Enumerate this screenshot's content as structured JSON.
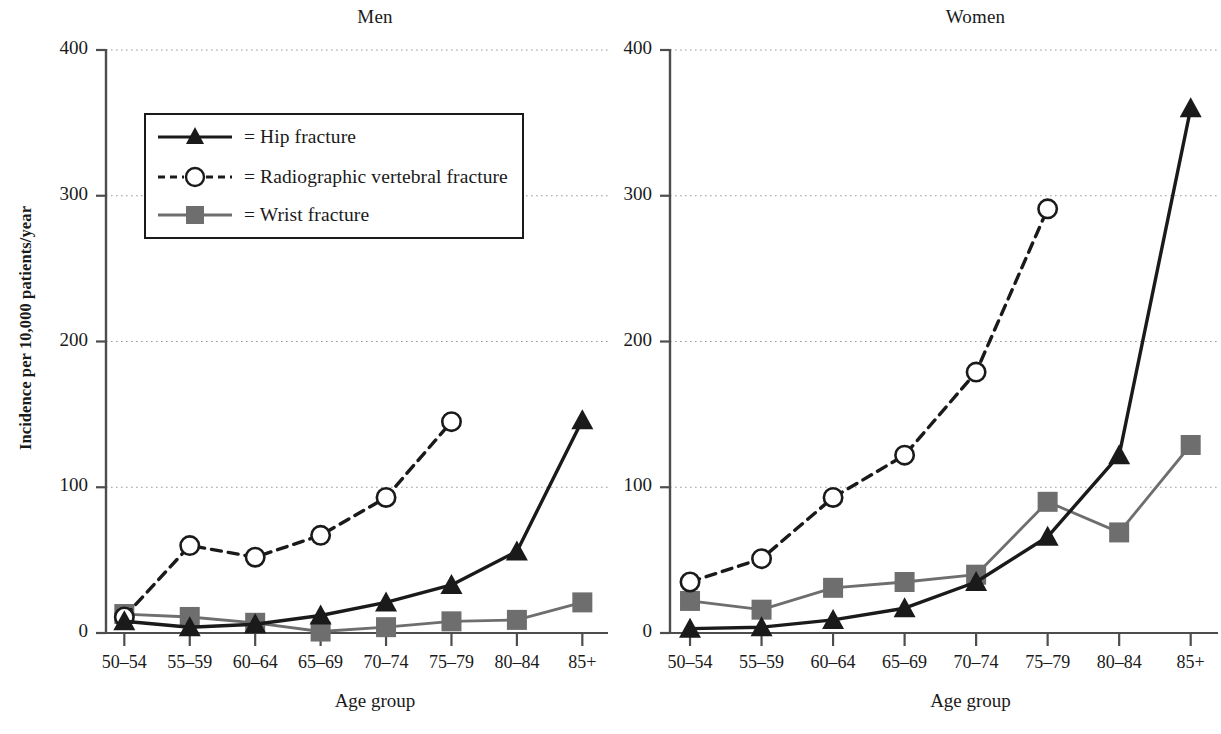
{
  "figure": {
    "axis_label_y": "Incidence per  10,000 patients/year",
    "axis_label_x": "Age group",
    "y_ticks": [
      "400",
      "300",
      "200",
      "100",
      "0"
    ],
    "x_ticks": [
      "50–54",
      "55–59",
      "60–64",
      "65–69",
      "70–74",
      "75–79",
      "80–84",
      "85+"
    ],
    "legend": {
      "hip": "= Hip fracture",
      "vertebral": "= Radiographic vertebral fracture",
      "wrist": "= Wrist fracture"
    },
    "colors": {
      "hip": "#1a1a1a",
      "vertebral": "#1a1a1a",
      "wrist": "#6e6e6e",
      "grid": "#9a9a9a",
      "axis": "#4d4d4d"
    },
    "panel_men_title": "Men",
    "panel_women_title": "Women"
  },
  "chart_data": [
    {
      "type": "line",
      "title": "Men",
      "xlabel": "Age group",
      "ylabel": "Incidence per 10,000 patients/year",
      "ylim": [
        0,
        400
      ],
      "yticks": [
        0,
        100,
        200,
        300,
        400
      ],
      "grid": true,
      "legend_position": "upper-left-inset",
      "categories": [
        "50-54",
        "55-59",
        "60-64",
        "65-69",
        "70-74",
        "75-79",
        "80-84",
        "85+"
      ],
      "series": [
        {
          "name": "Hip fracture",
          "marker": "filled-triangle",
          "linestyle": "solid",
          "color": "#1a1a1a",
          "values": [
            8,
            4,
            6,
            12,
            21,
            33,
            56,
            146
          ]
        },
        {
          "name": "Radiographic vertebral fracture",
          "marker": "open-circle",
          "linestyle": "dashed",
          "color": "#1a1a1a",
          "values": [
            11,
            60,
            52,
            67,
            93,
            145,
            null,
            null
          ]
        },
        {
          "name": "Wrist fracture",
          "marker": "filled-square",
          "linestyle": "solid",
          "color": "#6e6e6e",
          "values": [
            13,
            11,
            7,
            1,
            4,
            8,
            9,
            21
          ]
        }
      ]
    },
    {
      "type": "line",
      "title": "Women",
      "xlabel": "Age group",
      "ylabel": "Incidence per 10,000 patients/year",
      "ylim": [
        0,
        400
      ],
      "yticks": [
        0,
        100,
        200,
        300,
        400
      ],
      "grid": true,
      "legend_position": "none",
      "categories": [
        "50-54",
        "55-59",
        "60-64",
        "65-69",
        "70-74",
        "75-79",
        "80-84",
        "85+"
      ],
      "series": [
        {
          "name": "Hip fracture",
          "marker": "filled-triangle",
          "linestyle": "solid",
          "color": "#1a1a1a",
          "values": [
            3,
            4,
            9,
            17,
            35,
            66,
            122,
            360
          ]
        },
        {
          "name": "Radiographic vertebral fracture",
          "marker": "open-circle",
          "linestyle": "dashed",
          "color": "#1a1a1a",
          "values": [
            35,
            51,
            93,
            122,
            179,
            291,
            null,
            null
          ]
        },
        {
          "name": "Wrist fracture",
          "marker": "filled-square",
          "linestyle": "solid",
          "color": "#6e6e6e",
          "values": [
            22,
            16,
            31,
            35,
            40,
            90,
            69,
            129
          ]
        }
      ]
    }
  ]
}
